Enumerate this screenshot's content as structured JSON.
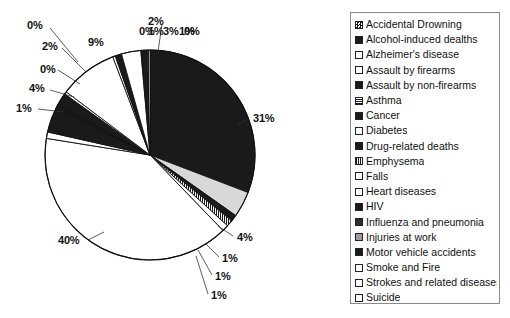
{
  "chart_data": {
    "type": "pie",
    "title": "",
    "legend_position": "right",
    "categories": [
      "Heart diseases",
      "Cancer",
      "Strokes and related diseases",
      "Emphysema",
      "Influenza and pneumonia",
      "Diabetes",
      "Accidental Drowning",
      "Motor vehicle accidents",
      "HIV",
      "Suicide",
      "Alcohol-induced deaths",
      "Injuries at work",
      "Drug-related deaths",
      "Falls",
      "Assault by firearms",
      "Assault by non-firearms",
      "Smoke and Fire",
      "Asthma"
    ],
    "values": [
      40,
      31,
      9,
      4,
      4,
      4,
      3,
      2,
      1,
      1,
      1,
      1,
      1,
      1,
      0,
      0,
      0,
      0
    ],
    "value_suffix": "%",
    "slice_labels": [
      "31%",
      "4%",
      "1%",
      "1%",
      "1%",
      "40%",
      "1%",
      "4%",
      "0%",
      "2%",
      "0%",
      "9%",
      "0%",
      "1%",
      "3%",
      "1%",
      "0%"
    ]
  },
  "slices": [
    {
      "label": "31%",
      "value": 31,
      "fill": "solid-black"
    },
    {
      "label": "4%",
      "value": 4,
      "fill": "light-gray"
    },
    {
      "label": "1%",
      "value": 1,
      "fill": "solid-black"
    },
    {
      "label": "1%",
      "value": 1,
      "fill": "mid-gray"
    },
    {
      "label": "1%",
      "value": 1,
      "fill": "white"
    },
    {
      "label": "40%",
      "value": 40,
      "fill": "white"
    },
    {
      "label": "1%",
      "value": 1,
      "fill": "white"
    },
    {
      "label": "4%",
      "value": 4,
      "fill": "solid-black"
    },
    {
      "label": "0%",
      "value": 0.4,
      "fill": "solid-black"
    },
    {
      "label": "2%",
      "value": 2,
      "fill": "solid-black"
    },
    {
      "label": "0%",
      "value": 0.4,
      "fill": "white"
    },
    {
      "label": "9%",
      "value": 9,
      "fill": "white"
    },
    {
      "label": "0%",
      "value": 0.4,
      "fill": "white"
    },
    {
      "label": "1%",
      "value": 1,
      "fill": "solid-black"
    },
    {
      "label": "3%",
      "value": 3,
      "fill": "white"
    },
    {
      "label": "1%",
      "value": 1,
      "fill": "solid-black"
    },
    {
      "label": "0%",
      "value": 0.4,
      "fill": "mid-gray"
    }
  ],
  "callouts": [
    {
      "text": "0%",
      "x": 27,
      "y": 20
    },
    {
      "text": "2%",
      "x": 42,
      "y": 41
    },
    {
      "text": "0%",
      "x": 40,
      "y": 64
    },
    {
      "text": "4%",
      "x": 29,
      "y": 83
    },
    {
      "text": "1%",
      "x": 16,
      "y": 103
    },
    {
      "text": "9%",
      "x": 88,
      "y": 37
    },
    {
      "text": "2%",
      "x": 148,
      "y": 16
    },
    {
      "text": "0%",
      "x": 139,
      "y": 26
    },
    {
      "text": "1%",
      "x": 148,
      "y": 26
    },
    {
      "text": "3%",
      "x": 163,
      "y": 26
    },
    {
      "text": "1%",
      "x": 179,
      "y": 26
    },
    {
      "text": "0%",
      "x": 184,
      "y": 26
    },
    {
      "text": "31%",
      "x": 253,
      "y": 113
    },
    {
      "text": "4%",
      "x": 237,
      "y": 232
    },
    {
      "text": "1%",
      "x": 222,
      "y": 253
    },
    {
      "text": "1%",
      "x": 215,
      "y": 271
    },
    {
      "text": "1%",
      "x": 211,
      "y": 290
    },
    {
      "text": "40%",
      "x": 58,
      "y": 235
    }
  ],
  "legend": {
    "items": [
      {
        "label": "Accidental Drowning",
        "swatch": "checker"
      },
      {
        "label": "Alcohol-induced dealths",
        "swatch": "solid"
      },
      {
        "label": "Alzheimer's disease",
        "swatch": "white"
      },
      {
        "label": "Assault by firearms",
        "swatch": "white"
      },
      {
        "label": "Assault by non-firearms",
        "swatch": "solid"
      },
      {
        "label": "Asthma",
        "swatch": "hatch"
      },
      {
        "label": "Cancer",
        "swatch": "solid"
      },
      {
        "label": "Diabetes",
        "swatch": "white"
      },
      {
        "label": "Drug-related deaths",
        "swatch": "solid"
      },
      {
        "label": "Emphysema",
        "swatch": "hatch2"
      },
      {
        "label": "Falls",
        "swatch": "white"
      },
      {
        "label": "Heart diseases",
        "swatch": "white"
      },
      {
        "label": "HIV",
        "swatch": "solid"
      },
      {
        "label": "Influenza and pneumonia",
        "swatch": "dark"
      },
      {
        "label": "Injuries at work",
        "swatch": "gray"
      },
      {
        "label": "Motor vehicle accidents",
        "swatch": "solid"
      },
      {
        "label": "Smoke and Fire",
        "swatch": "white"
      },
      {
        "label": "Strokes and related diseases",
        "swatch": "white"
      },
      {
        "label": "Suicide",
        "swatch": "white"
      }
    ]
  }
}
